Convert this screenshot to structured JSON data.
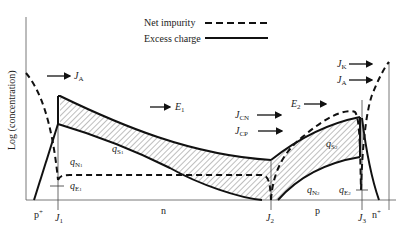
{
  "legend": {
    "net_impurity": "Net impurity",
    "excess_charge": "Excess charge"
  },
  "axis": {
    "ylabel": "Log (concentration)"
  },
  "regions": {
    "p_plus": "p",
    "p_plus_sup": "+",
    "n": "n",
    "p": "p",
    "n_plus": "n",
    "n_plus_sup": "+"
  },
  "junctions": {
    "j1": {
      "main": "J",
      "sub": "1"
    },
    "j2": {
      "main": "J",
      "sub": "2"
    },
    "j3": {
      "main": "J",
      "sub": "3"
    }
  },
  "currents": {
    "ja_left": {
      "main": "J",
      "sub": "A"
    },
    "e1": {
      "main": "E",
      "sub": "1"
    },
    "jcn": {
      "main": "J",
      "sub": "CN"
    },
    "jcp": {
      "main": "J",
      "sub": "CP"
    },
    "e2": {
      "main": "E",
      "sub": "2"
    },
    "jk": {
      "main": "J",
      "sub": "K"
    },
    "ja_right": {
      "main": "J",
      "sub": "A"
    }
  },
  "charges": {
    "qs1": {
      "main": "q",
      "sub": "S",
      "subsub": "1"
    },
    "qn1": {
      "main": "q",
      "sub": "N",
      "subsub": "1"
    },
    "qe1": {
      "main": "q",
      "sub": "E",
      "subsub": "1"
    },
    "qs2": {
      "main": "q",
      "sub": "S",
      "subsub": "2"
    },
    "qn2": {
      "main": "q",
      "sub": "N",
      "subsub": "2"
    },
    "qe2": {
      "main": "q",
      "sub": "E",
      "subsub": "2"
    }
  }
}
